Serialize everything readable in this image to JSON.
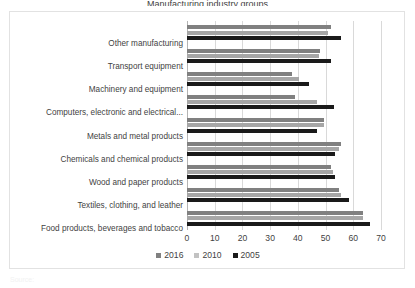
{
  "title_sliver": "Manufacturing industry groups",
  "footnote": "Source:",
  "legend": {
    "position": "bottom",
    "items": [
      {
        "label": "2016",
        "color": "#808080"
      },
      {
        "label": "2010",
        "color": "#c2c2c2"
      },
      {
        "label": "2005",
        "color": "#1a1a1a"
      }
    ]
  },
  "axis": {
    "ticks": [
      "0",
      "10",
      "20",
      "30",
      "40",
      "50",
      "60",
      "70"
    ]
  },
  "chart_data": {
    "type": "bar",
    "orientation": "horizontal",
    "title": "",
    "xlabel": "",
    "ylabel": "",
    "xlim": [
      0,
      70
    ],
    "grid": true,
    "legend_position": "bottom",
    "categories": [
      "Other manufacturing",
      "Transport equipment",
      "Machinery and equipment",
      "Computers, electronic and electrical...",
      "Metals and  metal products",
      "Chemicals and chemical products",
      "Wood and paper products",
      "Textiles, clothing, and leather",
      "Food products, beverages and tobacco"
    ],
    "series": [
      {
        "name": "2016",
        "color": "#808080",
        "values": [
          52.0,
          48.0,
          38.0,
          39.0,
          49.5,
          55.5,
          52.0,
          55.0,
          63.5
        ]
      },
      {
        "name": "2010",
        "color": "#a6a6a6",
        "values": [
          51.0,
          47.5,
          40.5,
          47.0,
          49.5,
          55.0,
          52.5,
          55.5,
          63.5
        ]
      },
      {
        "name": "2005",
        "color": "#1a1a1a",
        "values": [
          55.5,
          52.0,
          44.0,
          53.0,
          47.0,
          53.5,
          53.5,
          58.5,
          66.0
        ]
      }
    ]
  }
}
